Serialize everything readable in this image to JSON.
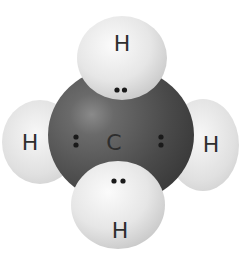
{
  "diagram": {
    "molecule": "methane",
    "central_atom": {
      "label": "C",
      "color": "#4a4a4a"
    },
    "hydrogens": [
      {
        "position": "top",
        "label": "H"
      },
      {
        "position": "left",
        "label": "H"
      },
      {
        "position": "right",
        "label": "H"
      },
      {
        "position": "bottom",
        "label": "H"
      }
    ],
    "bonding_pairs": [
      {
        "position": "top",
        "electrons": 2
      },
      {
        "position": "left",
        "electrons": 2
      },
      {
        "position": "right",
        "electrons": 2
      },
      {
        "position": "bottom",
        "electrons": 2
      }
    ],
    "colors": {
      "hydrogen": "#e8e8e8",
      "carbon": "#4a4a4a",
      "electron": "#1a1a1a",
      "label": "#2e2e2e"
    }
  }
}
